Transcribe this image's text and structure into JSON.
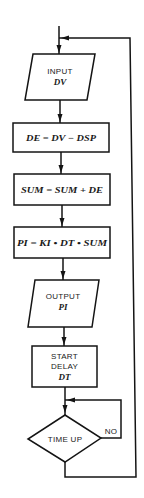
{
  "diagram": {
    "type": "flowchart",
    "colors": {
      "stroke": "#141414",
      "background": "#ffffff",
      "text": "#1a1a1a"
    },
    "nodes": {
      "input": {
        "shape": "parallelogram",
        "label": "INPUT",
        "variable": "DV"
      },
      "compute_error": {
        "shape": "rectangle",
        "formula": "DE = DV − DSP"
      },
      "accumulate": {
        "shape": "rectangle",
        "formula": "SUM = SUM + DE"
      },
      "integral": {
        "shape": "rectangle",
        "formula": "PI = KI • DT • SUM"
      },
      "output": {
        "shape": "parallelogram",
        "label": "OUTPUT",
        "variable": "PI"
      },
      "delay": {
        "shape": "rectangle",
        "line1": "START",
        "line2": "DELAY",
        "variable": "DT"
      },
      "decision": {
        "shape": "diamond",
        "label": "TIME UP",
        "no_label": "NO"
      }
    },
    "edges": [
      {
        "from": "entry",
        "to": "input"
      },
      {
        "from": "input",
        "to": "compute_error"
      },
      {
        "from": "compute_error",
        "to": "accumulate"
      },
      {
        "from": "accumulate",
        "to": "integral"
      },
      {
        "from": "integral",
        "to": "output"
      },
      {
        "from": "output",
        "to": "delay"
      },
      {
        "from": "delay",
        "to": "decision"
      },
      {
        "from": "decision",
        "to": "decision",
        "label": "NO"
      },
      {
        "from": "decision",
        "to": "input",
        "label": ""
      }
    ]
  }
}
